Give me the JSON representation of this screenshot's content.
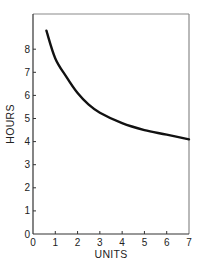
{
  "chart_data": {
    "type": "line",
    "title": "",
    "xlabel": "UNITS",
    "ylabel": "HOURS",
    "xlim": [
      0,
      7
    ],
    "ylim": [
      0,
      9
    ],
    "xticks": [
      "0",
      "1",
      "2",
      "3",
      "4",
      "5",
      "6",
      "7"
    ],
    "yticks": [
      "0",
      "1",
      "2",
      "3",
      "4",
      "5",
      "6",
      "7",
      "8"
    ],
    "grid": false,
    "legend": null,
    "series": [
      {
        "name": "hours-per-unit curve",
        "x": [
          0.6,
          1,
          1.5,
          2,
          2.5,
          3,
          4,
          5,
          6,
          7
        ],
        "y": [
          8.8,
          7.6,
          6.8,
          6.1,
          5.6,
          5.25,
          4.8,
          4.5,
          4.3,
          4.1
        ]
      }
    ]
  },
  "colors": {
    "line": "#111111",
    "frame": "#8a8a8a",
    "axis": "#333333"
  }
}
